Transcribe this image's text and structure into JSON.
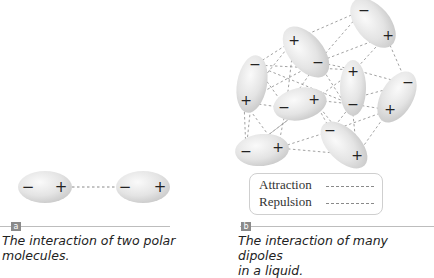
{
  "panel_a": {
    "label": "a",
    "caption_line1": "The interaction of two polar",
    "caption_line2": "molecules.",
    "molecules": [
      {
        "cx": 44,
        "cy": 187,
        "rx": 26,
        "ry": 16,
        "angle": 0,
        "neg": [
          -17,
          0
        ],
        "pos": [
          16,
          0
        ]
      },
      {
        "cx": 142,
        "cy": 187,
        "rx": 26,
        "ry": 16,
        "angle": 0,
        "neg": [
          -17,
          0
        ],
        "pos": [
          16,
          0
        ]
      }
    ],
    "interaction": "attraction"
  },
  "panel_b": {
    "label": "b",
    "caption_line1": "The interaction of many dipoles",
    "caption_line2": "in a liquid.",
    "legend": {
      "attraction": "Attraction",
      "repulsion": "Repulsion"
    }
  },
  "symbols": {
    "negative": "−",
    "positive": "+"
  },
  "colors": {
    "molecule_fill": "#e6e6e6",
    "molecule_edge": "#c8c8c8",
    "dash_line": "#8a8a8a",
    "label_box": "#8a8a8a",
    "caption_text": "#222222"
  }
}
